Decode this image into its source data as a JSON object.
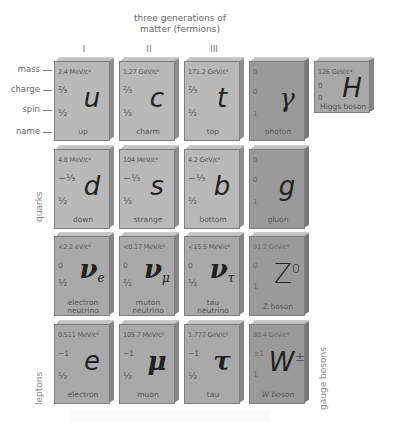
{
  "header": {
    "title_line1": "three generations of",
    "title_line2": "matter (fermions)"
  },
  "generations": [
    "I",
    "II",
    "III"
  ],
  "row_labels": {
    "mass": "mass",
    "charge": "charge",
    "spin": "spin",
    "name": "name"
  },
  "group_labels": {
    "quarks": "quarks",
    "leptons": "leptons",
    "gauge_bosons": "gauge bosons"
  },
  "particles": {
    "up": {
      "mass": "2.4 MeV/c²",
      "charge": "⅔",
      "spin": "½",
      "symbol": "u",
      "name": "up"
    },
    "charm": {
      "mass": "1.27 GeV/c²",
      "charge": "⅔",
      "spin": "½",
      "symbol": "c",
      "name": "charm"
    },
    "top": {
      "mass": "171.2 GeV/c²",
      "charge": "⅔",
      "spin": "½",
      "symbol": "t",
      "name": "top"
    },
    "photon": {
      "mass": "0",
      "charge": "0",
      "spin": "1",
      "symbol": "γ",
      "name": "photon"
    },
    "higgs": {
      "mass": "126 GeV/c²",
      "charge": "0",
      "spin": "0",
      "symbol": "H",
      "name": "Higgs boson"
    },
    "down": {
      "mass": "4.8 MeV/c²",
      "charge": "−⅓",
      "spin": "½",
      "symbol": "d",
      "name": "down"
    },
    "strange": {
      "mass": "104 MeV/c²",
      "charge": "−⅓",
      "spin": "½",
      "symbol": "s",
      "name": "strange"
    },
    "bottom": {
      "mass": "4.2 GeV/c²",
      "charge": "−⅓",
      "spin": "½",
      "symbol": "b",
      "name": "bottom"
    },
    "gluon": {
      "mass": "0",
      "charge": "0",
      "spin": "1",
      "symbol": "g",
      "name": "gluon"
    },
    "nu_e": {
      "mass": "<2.2 eV/c²",
      "charge": "0",
      "spin": "½",
      "symbol": "ν",
      "sub": "e",
      "name1": "electron",
      "name2": "neutrino"
    },
    "nu_mu": {
      "mass": "<0.17 MeV/c²",
      "charge": "0",
      "spin": "½",
      "symbol": "ν",
      "sub": "μ",
      "name1": "muton",
      "name2": "neutrino"
    },
    "nu_tau": {
      "mass": "<15.5 MeV/c²",
      "charge": "0",
      "spin": "½",
      "symbol": "ν",
      "sub": "τ",
      "name1": "tau",
      "name2": "neutrino"
    },
    "z": {
      "mass": "91.2 GeV/c²",
      "charge": "0",
      "spin": "1",
      "symbol": "Z",
      "sup": "0",
      "name": "Z boson"
    },
    "electron": {
      "mass": "0.511 MeV/c²",
      "charge": "−1",
      "spin": "½",
      "symbol": "e",
      "name": "electron"
    },
    "muon": {
      "mass": "105.7 MeV/c²",
      "charge": "−1",
      "spin": "½",
      "symbol": "μ",
      "name": "muon"
    },
    "tau": {
      "mass": "1.777 GeV/c²",
      "charge": "−1",
      "spin": "½",
      "symbol": "τ",
      "name": "tau"
    },
    "w": {
      "mass": "80.4 GeV/c²",
      "charge": "±1",
      "spin": "1",
      "symbol": "W",
      "sup": "±",
      "name": "W boson"
    }
  }
}
